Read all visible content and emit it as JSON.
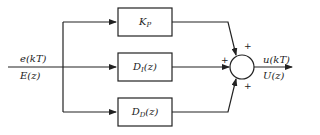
{
  "diagram": {
    "type": "block-diagram",
    "title": "",
    "input": {
      "time_label": "e(kT)",
      "z_label": "E(z)"
    },
    "output": {
      "time_label": "u(kT)",
      "z_label": "U(z)"
    },
    "blocks": [
      {
        "id": "proportional",
        "main": "K",
        "sub": "P",
        "suffix": ""
      },
      {
        "id": "integral",
        "main": "D",
        "sub": "I",
        "suffix": "(z)"
      },
      {
        "id": "derivative",
        "main": "D",
        "sub": "D",
        "suffix": "(z)"
      }
    ],
    "summing_junction": {
      "signs": [
        "+",
        "+",
        "+"
      ]
    },
    "colors": {
      "line": "#222222",
      "background": "#ffffff"
    }
  }
}
